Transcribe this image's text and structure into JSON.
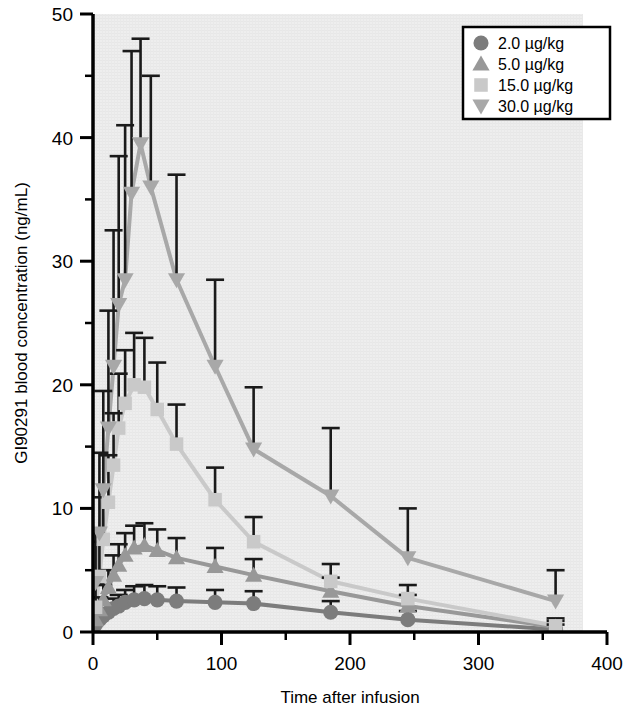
{
  "chart_data": {
    "type": "line",
    "title": "",
    "xlabel": "Time after infusion",
    "ylabel": "GI90291 blood concentration (ng/mL)",
    "xlim": [
      0,
      400
    ],
    "ylim": [
      0,
      50
    ],
    "xticks": [
      0,
      100,
      200,
      300,
      400
    ],
    "xtick_labels": [
      "0",
      "100",
      "200",
      "300",
      "400"
    ],
    "xminor_ticks": [
      50,
      150,
      250,
      350
    ],
    "yticks": [
      0,
      10,
      20,
      30,
      40,
      50
    ],
    "ytick_labels": [
      "0",
      "10",
      "20",
      "30",
      "40",
      "50"
    ],
    "yminor_ticks": [
      5,
      15,
      25,
      35,
      45
    ],
    "grid": false,
    "legend_position": "top-right",
    "error_bars": "upper-only (SD)",
    "plot_background": "#ededed",
    "series": [
      {
        "name": "2.0 µg/kg",
        "marker": "circle",
        "color": "#7c7c7c",
        "x": [
          2,
          5,
          8,
          12,
          16,
          20,
          25,
          32,
          40,
          50,
          65,
          95,
          125,
          185,
          245,
          360
        ],
        "values": [
          0.6,
          1.0,
          1.3,
          1.6,
          1.9,
          2.1,
          2.4,
          2.6,
          2.7,
          2.6,
          2.5,
          2.4,
          2.3,
          1.6,
          1.0,
          0.2
        ],
        "errors": [
          0.4,
          0.5,
          0.6,
          0.7,
          0.8,
          0.9,
          1.0,
          1.1,
          1.1,
          1.1,
          1.1,
          1.0,
          1.0,
          0.9,
          0.7,
          0.4
        ]
      },
      {
        "name": "5.0 µg/kg",
        "marker": "triangle-up",
        "color": "#989898",
        "x": [
          2,
          5,
          8,
          12,
          16,
          20,
          25,
          32,
          40,
          50,
          65,
          95,
          125,
          185,
          245,
          360
        ],
        "values": [
          1.0,
          1.8,
          2.6,
          3.6,
          4.6,
          5.4,
          6.2,
          6.8,
          7.0,
          6.6,
          6.0,
          5.3,
          4.6,
          3.3,
          2.1,
          0.4
        ],
        "errors": [
          0.8,
          1.0,
          1.2,
          1.4,
          1.6,
          1.7,
          1.8,
          1.8,
          1.8,
          1.7,
          1.6,
          1.5,
          1.3,
          1.1,
          0.9,
          0.5
        ]
      },
      {
        "name": "15.0 µg/kg",
        "marker": "square",
        "color": "#c9c9c9",
        "x": [
          2,
          5,
          8,
          12,
          16,
          20,
          25,
          32,
          40,
          50,
          65,
          95,
          125,
          185,
          245,
          360
        ],
        "values": [
          2.0,
          4.5,
          7.5,
          10.5,
          13.5,
          16.5,
          18.5,
          20.0,
          19.8,
          18.0,
          15.2,
          10.7,
          7.3,
          4.1,
          2.7,
          0.5
        ],
        "errors": [
          2.0,
          2.8,
          3.4,
          3.8,
          4.2,
          4.4,
          4.3,
          4.2,
          4.0,
          3.8,
          3.2,
          2.6,
          2.0,
          1.4,
          1.1,
          0.6
        ]
      },
      {
        "name": "30.0 µg/kg",
        "marker": "triangle-down",
        "color": "#a8a8a8",
        "x": [
          2,
          5,
          8,
          12,
          16,
          20,
          25,
          30,
          37,
          45,
          65,
          95,
          125,
          185,
          245,
          360
        ],
        "values": [
          4.0,
          8.0,
          11.5,
          16.5,
          21.5,
          26.5,
          28.5,
          35.5,
          39.5,
          36.0,
          28.5,
          21.5,
          14.8,
          11.0,
          6.0,
          2.5
        ],
        "errors": [
          4.0,
          6.5,
          8.0,
          9.5,
          11.0,
          12.0,
          12.5,
          11.5,
          8.5,
          9.0,
          8.5,
          7.0,
          5.0,
          5.5,
          4.0,
          2.5
        ]
      }
    ],
    "legend": [
      {
        "label": "2.0 µg/kg",
        "marker": "circle",
        "color": "#7c7c7c"
      },
      {
        "label": "5.0 µg/kg",
        "marker": "triangle-up",
        "color": "#989898"
      },
      {
        "label": "15.0 µg/kg",
        "marker": "square",
        "color": "#c9c9c9"
      },
      {
        "label": "30.0 µg/kg",
        "marker": "triangle-down",
        "color": "#a8a8a8"
      }
    ]
  }
}
